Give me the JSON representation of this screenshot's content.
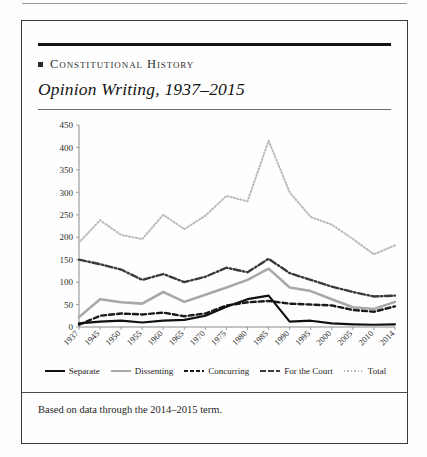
{
  "page": {
    "kicker": "Constitutional History",
    "subtitle": "Opinion Writing, 1937–2015",
    "caption": "Based on data through the 2014–2015 term."
  },
  "colors": {
    "separate": "#111111",
    "dissenting": "#a8a8a8",
    "concurring": "#1a1a1a",
    "for_the_court": "#3a3a3a",
    "total": "#b9b9b9",
    "axis": "#8a8a8a",
    "rule": "#141414"
  },
  "chart_data": {
    "type": "line",
    "title": "Opinion Writing, 1937–2015",
    "xlabel": "",
    "ylabel": "",
    "ylim": [
      0,
      450
    ],
    "ytick_step": 50,
    "yticks": [
      0,
      50,
      100,
      150,
      200,
      250,
      300,
      350,
      400,
      450
    ],
    "grid": false,
    "legend_position": "bottom",
    "categories": [
      "1937",
      "1945",
      "1950",
      "1955",
      "1960",
      "1965",
      "1970",
      "1975",
      "1980",
      "1985",
      "1990",
      "1995",
      "2000",
      "2005",
      "2010",
      "2014"
    ],
    "series": [
      {
        "name": "Separate",
        "style": "solid",
        "color": "#111111",
        "width": 2.2,
        "values": [
          8,
          12,
          14,
          10,
          14,
          16,
          25,
          45,
          62,
          70,
          12,
          14,
          8,
          6,
          5,
          6
        ]
      },
      {
        "name": "Dissenting",
        "style": "solid",
        "color": "#a8a8a8",
        "width": 2.6,
        "values": [
          22,
          62,
          55,
          52,
          78,
          56,
          72,
          88,
          105,
          130,
          88,
          80,
          62,
          44,
          40,
          56
        ]
      },
      {
        "name": "Concurring",
        "style": "dashed",
        "color": "#1a1a1a",
        "width": 2.4,
        "values": [
          5,
          25,
          30,
          28,
          32,
          24,
          30,
          48,
          55,
          58,
          52,
          50,
          48,
          38,
          34,
          46
        ]
      },
      {
        "name": "For the Court",
        "style": "dashdot",
        "color": "#3a3a3a",
        "width": 2.4,
        "values": [
          150,
          140,
          128,
          105,
          118,
          100,
          112,
          132,
          122,
          152,
          120,
          105,
          90,
          78,
          68,
          70
        ]
      },
      {
        "name": "Total",
        "style": "dotted",
        "color": "#b9b9b9",
        "width": 2.0,
        "values": [
          188,
          238,
          205,
          196,
          250,
          218,
          248,
          292,
          280,
          415,
          300,
          245,
          228,
          196,
          162,
          182
        ]
      }
    ]
  }
}
